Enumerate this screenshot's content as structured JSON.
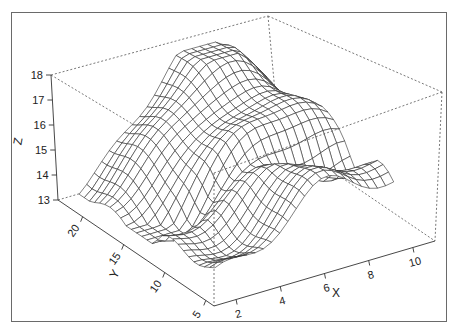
{
  "chart_data": {
    "type": "surface3d",
    "title": "",
    "xlabel": "X",
    "ylabel": "Y",
    "zlabel": "Z",
    "x_ticks": [
      2,
      4,
      6,
      8,
      10
    ],
    "y_ticks": [
      5,
      10,
      15,
      20
    ],
    "z_ticks": [
      13,
      14,
      15,
      16,
      17,
      18
    ],
    "xlim": [
      1,
      11
    ],
    "ylim": [
      4,
      23
    ],
    "zlim": [
      13,
      18
    ],
    "render": "wireframe mesh, white fill, perspective box with dotted edges"
  },
  "axes": {
    "x": {
      "label": "X",
      "ticks": [
        "2",
        "4",
        "6",
        "8",
        "10"
      ]
    },
    "y": {
      "label": "Y",
      "ticks": [
        "5",
        "10",
        "15",
        "20"
      ]
    },
    "z": {
      "label": "Z",
      "ticks": [
        "13",
        "14",
        "15",
        "16",
        "17",
        "18"
      ]
    }
  }
}
